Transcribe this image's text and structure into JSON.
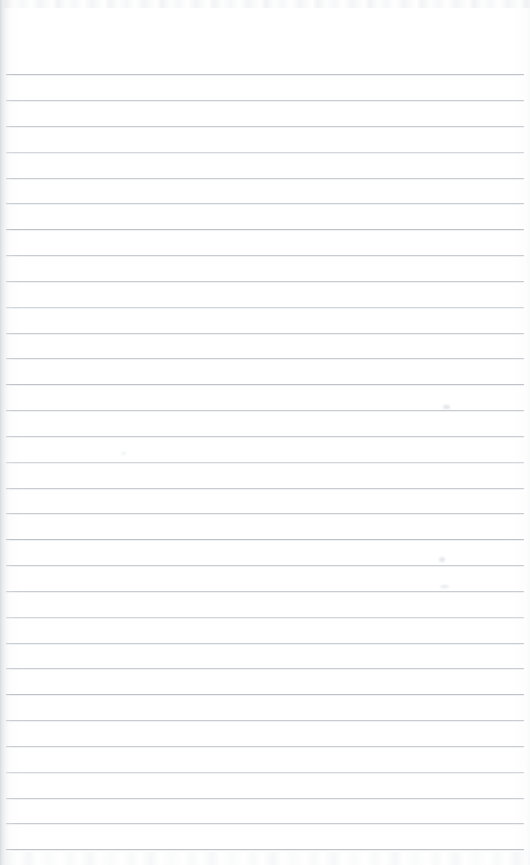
{
  "document": {
    "kind": "scanned-lined-notebook-page",
    "title": "Blank Lined Notebook Page",
    "page_width": 530,
    "page_height": 865,
    "paper_color": "#ffffff",
    "content_text": "",
    "handwriting_present": "no",
    "orientation": "portrait"
  },
  "ruling": {
    "line_color": "#c9ccd1",
    "line_color_faint": "#d3d6da",
    "line_color_dark": "#bfc3c9",
    "line_thickness_px": 1,
    "line_spacing_px": 25.9,
    "first_line_y": 74,
    "line_count": 31,
    "line_start_x": 6,
    "line_end_x": 524,
    "top_margin_height_px": 74,
    "style": "wide-ruled-horizontal",
    "lines": [
      {
        "y": 74,
        "x1": 6,
        "x2": 524,
        "tone": "dark"
      },
      {
        "y": 100,
        "x1": 6,
        "x2": 524,
        "tone": "normal"
      },
      {
        "y": 126,
        "x1": 6,
        "x2": 524,
        "tone": "normal"
      },
      {
        "y": 152,
        "x1": 6,
        "x2": 524,
        "tone": "faint"
      },
      {
        "y": 178,
        "x1": 6,
        "x2": 524,
        "tone": "normal"
      },
      {
        "y": 203,
        "x1": 6,
        "x2": 524,
        "tone": "normal"
      },
      {
        "y": 229,
        "x1": 6,
        "x2": 524,
        "tone": "dark"
      },
      {
        "y": 255,
        "x1": 6,
        "x2": 524,
        "tone": "normal"
      },
      {
        "y": 281,
        "x1": 6,
        "x2": 524,
        "tone": "normal"
      },
      {
        "y": 307,
        "x1": 6,
        "x2": 524,
        "tone": "faint"
      },
      {
        "y": 333,
        "x1": 6,
        "x2": 524,
        "tone": "normal"
      },
      {
        "y": 358,
        "x1": 6,
        "x2": 524,
        "tone": "normal"
      },
      {
        "y": 384,
        "x1": 6,
        "x2": 524,
        "tone": "dark"
      },
      {
        "y": 410,
        "x1": 6,
        "x2": 524,
        "tone": "normal"
      },
      {
        "y": 436,
        "x1": 6,
        "x2": 524,
        "tone": "normal"
      },
      {
        "y": 462,
        "x1": 6,
        "x2": 524,
        "tone": "faint"
      },
      {
        "y": 488,
        "x1": 6,
        "x2": 524,
        "tone": "normal"
      },
      {
        "y": 513,
        "x1": 6,
        "x2": 524,
        "tone": "normal"
      },
      {
        "y": 539,
        "x1": 6,
        "x2": 524,
        "tone": "dark"
      },
      {
        "y": 565,
        "x1": 6,
        "x2": 524,
        "tone": "normal"
      },
      {
        "y": 591,
        "x1": 6,
        "x2": 524,
        "tone": "normal"
      },
      {
        "y": 617,
        "x1": 6,
        "x2": 524,
        "tone": "faint"
      },
      {
        "y": 643,
        "x1": 6,
        "x2": 524,
        "tone": "normal"
      },
      {
        "y": 668,
        "x1": 6,
        "x2": 524,
        "tone": "normal"
      },
      {
        "y": 694,
        "x1": 6,
        "x2": 524,
        "tone": "dark"
      },
      {
        "y": 720,
        "x1": 6,
        "x2": 524,
        "tone": "normal"
      },
      {
        "y": 746,
        "x1": 6,
        "x2": 524,
        "tone": "normal"
      },
      {
        "y": 772,
        "x1": 6,
        "x2": 524,
        "tone": "faint"
      },
      {
        "y": 798,
        "x1": 6,
        "x2": 524,
        "tone": "normal"
      },
      {
        "y": 823,
        "x1": 6,
        "x2": 524,
        "tone": "normal"
      },
      {
        "y": 849,
        "x1": 6,
        "x2": 524,
        "tone": "dark"
      }
    ]
  },
  "artifacts": {
    "left_edge_shadow": {
      "x": 0,
      "width": 12,
      "color": "#c6cad0"
    },
    "right_edge_shadow": {
      "x": 522,
      "width": 8,
      "color": "#f0f1f3"
    },
    "top_noise_band": {
      "y": 0,
      "height": 8,
      "color": "#e9ebee"
    },
    "bottom_noise_band": {
      "y": 852,
      "height": 13,
      "color": "#ebedef"
    },
    "smudges": [
      {
        "x": 443,
        "y": 405,
        "w": 7,
        "h": 4,
        "color": "#e2e4e7"
      },
      {
        "x": 439,
        "y": 557,
        "w": 6,
        "h": 5,
        "color": "#e4e6e9"
      },
      {
        "x": 440,
        "y": 585,
        "w": 9,
        "h": 3,
        "color": "#e8eaec"
      },
      {
        "x": 121,
        "y": 452,
        "w": 5,
        "h": 3,
        "color": "#eef0f2"
      }
    ]
  }
}
